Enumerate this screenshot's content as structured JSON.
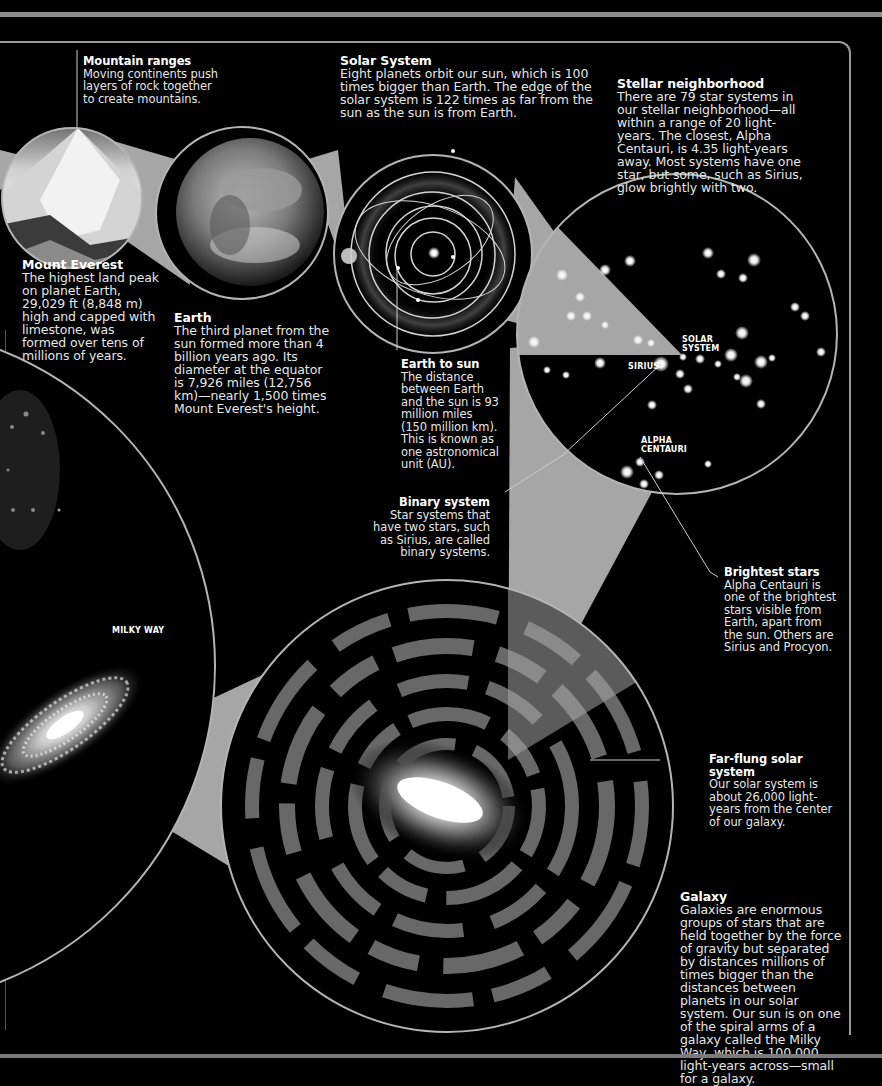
{
  "colors": {
    "background": "#000000",
    "cone": "#a6a6a6",
    "ring": "#b4b4b4",
    "frame": "#9a9a9a"
  },
  "sections": {
    "mountain_ranges": {
      "title": "Mountain ranges",
      "text": "Moving continents push layers of rock together to create mountains."
    },
    "mount_everest": {
      "title": "Mount Everest",
      "text": "The highest land peak on planet Earth, 29,029 ft (8,848 m) high and capped with limestone, was formed over tens of millions of years."
    },
    "earth": {
      "title": "Earth",
      "text": "The third planet from the sun formed more than 4 billion years ago. Its diameter at the equator is 7,926 miles (12,756 km)—nearly 1,500 times Mount Everest's height."
    },
    "solar_system": {
      "title": "Solar System",
      "text": "Eight planets orbit our sun, which is 100 times bigger than Earth. The edge of the solar system is 122 times as far from the sun as the sun is from Earth."
    },
    "earth_to_sun": {
      "title": "Earth to sun",
      "text": "The distance between Earth and the sun is 93 million miles (150 million km). This is known as one astronomical unit (AU)."
    },
    "stellar_neighborhood": {
      "title": "Stellar neighborhood",
      "text": "There are 79 star systems in our stellar neighborhood—all within a range of 20 light-years. The closest, Alpha Centauri, is 4.35 light-years away. Most systems have one star, but some, such as Sirius, glow brightly with two."
    },
    "binary_system": {
      "title": "Binary system",
      "text": "Star systems that have two stars, such as Sirius, are called binary systems."
    },
    "brightest_stars": {
      "title": "Brightest stars",
      "text": "Alpha Centauri is one of the brightest stars visible from Earth, apart from the sun. Others are Sirius and Procyon."
    },
    "far_flung": {
      "title": "Far-flung solar system",
      "text": "Our solar system is about 26,000 light-years from the center of our galaxy."
    },
    "galaxy": {
      "title": "Galaxy",
      "text": "Galaxies are enormous groups of stars that are held together by the force of gravity but separated by distances millions of times bigger than the distances between planets in our solar system. Our sun is on one of the spiral arms of a galaxy called the Milky Way, which is 100,000 light-years across—small for a galaxy."
    }
  },
  "tags": {
    "solar_system": "SOLAR\nSYSTEM",
    "sirius": "SIRIUS",
    "alpha_centauri": "ALPHA\nCENTAURI",
    "milky_way": "MILKY WAY"
  }
}
